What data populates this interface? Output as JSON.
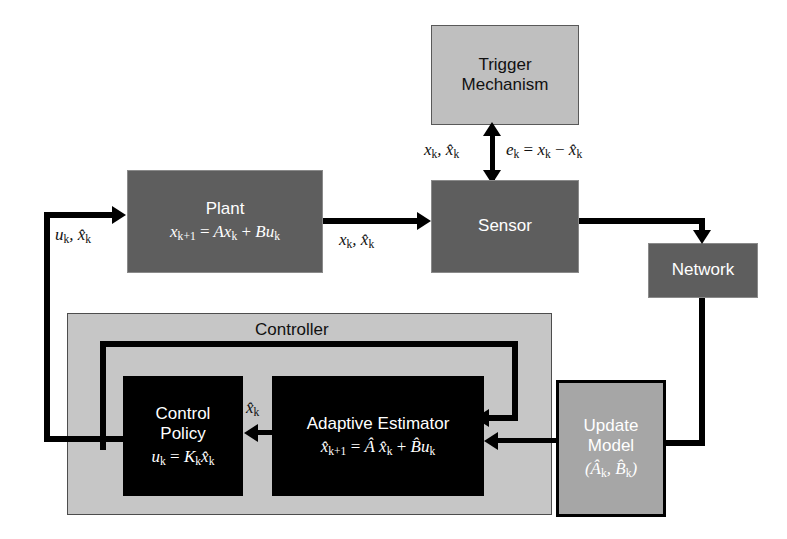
{
  "diagram": {
    "colors": {
      "block_dark_gray": "#5e5e5e",
      "block_light_gray": "#bfbfbf",
      "block_black": "#000000",
      "block_mid_gray": "#a6a6a6",
      "container_gray": "#c6c6c6",
      "line": "#000000",
      "background": "#ffffff"
    }
  },
  "blocks": {
    "trigger": {
      "label": "Trigger",
      "label2": "Mechanism"
    },
    "plant": {
      "label": "Plant",
      "equation": "x_{k+1} = Ax_k + Bu_k"
    },
    "sensor": {
      "label": "Sensor"
    },
    "network": {
      "label": "Network"
    },
    "update_model": {
      "label": "Update",
      "label2": "Model",
      "equation": "(Â_k, B̂_k)"
    },
    "controller": {
      "label": "Controller"
    },
    "control_policy": {
      "label": "Control",
      "label2": "Policy",
      "equation": "u_k = K_k x̂_k"
    },
    "adaptive_estimator": {
      "label": "Adaptive Estimator",
      "equation": "x̂_{k+1} = Â x̂_k + B̂u_k"
    }
  },
  "edge_labels": {
    "plant_input": "u_k, x̂_k",
    "plant_to_sensor": "x_k, x̂_k",
    "sensor_to_trigger": "x_k, x̂_k",
    "trigger_error": "e_k = x_k − x̂_k",
    "estimator_to_policy": "x̂_k"
  }
}
